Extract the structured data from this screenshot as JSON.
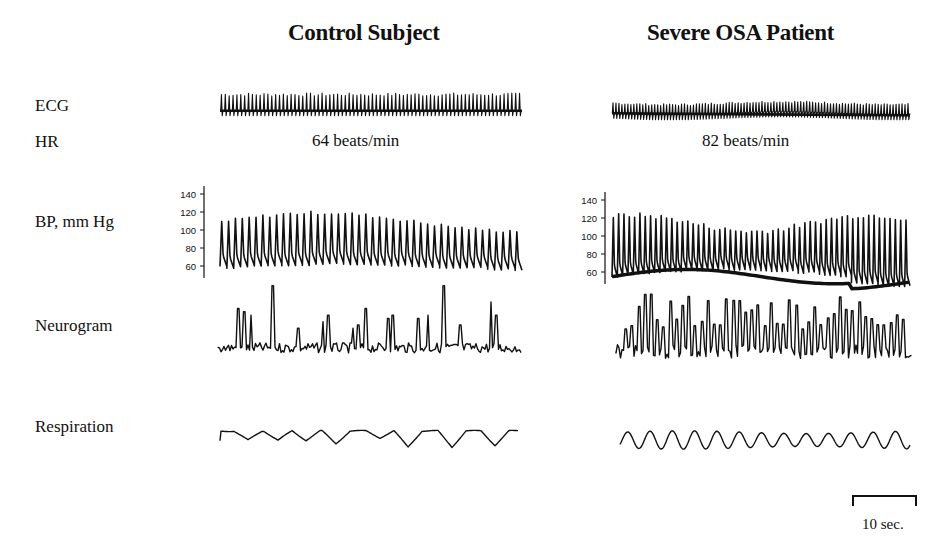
{
  "columns": [
    {
      "title": "Control Subject",
      "hr_text": "64 beats/min"
    },
    {
      "title": "Severe OSA Patient",
      "hr_text": "82 beats/min"
    }
  ],
  "row_labels": {
    "ecg": "ECG",
    "hr": "HR",
    "bp": "BP, mm Hg",
    "neurogram": "Neurogram",
    "respiration": "Respiration"
  },
  "bp_axis_ticks": [
    "140",
    "120",
    "100",
    "80",
    "60"
  ],
  "scale_bar": {
    "label": "10 sec."
  },
  "chart_data": {
    "type": "line",
    "panels": [
      {
        "subject": "Control Subject",
        "heart_rate_bpm": 64,
        "ecg": {
          "beats": 64,
          "description": "regular QRS complexes"
        },
        "bp": {
          "ylabel": "BP, mm Hg",
          "ylim": [
            55,
            145
          ],
          "ticks": [
            60,
            80,
            100,
            120,
            140
          ],
          "systolic_approx": [
            120,
            130
          ],
          "diastolic_approx": [
            65,
            75
          ],
          "beats": 44
        },
        "neurogram": {
          "description": "sympathetic bursts, low frequency",
          "major_burst_count": 14
        },
        "respiration": {
          "cycles": 12,
          "description": "regular breathing with deeper dips"
        }
      },
      {
        "subject": "Severe OSA Patient",
        "heart_rate_bpm": 82,
        "ecg": {
          "beats": 82,
          "description": "regular, faster QRS complexes"
        },
        "bp": {
          "ylabel": "BP, mm Hg",
          "ylim": [
            55,
            145
          ],
          "ticks": [
            60,
            80,
            100,
            120,
            140
          ],
          "systolic_approx": [
            115,
            135
          ],
          "diastolic_approx": [
            60,
            78
          ],
          "beats": 56
        },
        "neurogram": {
          "description": "markedly increased burst frequency and amplitude",
          "major_burst_count": 45
        },
        "respiration": {
          "cycles": 13,
          "description": "regular sinusoidal breathing"
        }
      }
    ],
    "time_scale": "10 sec.",
    "legend": []
  }
}
